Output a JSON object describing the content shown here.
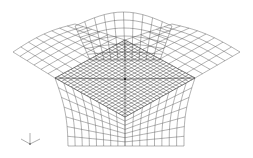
{
  "figure": {
    "regions": [
      {
        "name": "left-wing-surface",
        "grid_u": 8,
        "grid_v": 6
      },
      {
        "name": "right-wing-surface",
        "grid_u": 8,
        "grid_v": 6
      },
      {
        "name": "top-bulge-surface",
        "grid_u": 10,
        "grid_v": 6
      },
      {
        "name": "dense-center-square",
        "grid_u": 22,
        "grid_v": 22
      },
      {
        "name": "left-vertical-wall",
        "grid_u": 8,
        "grid_v": 7
      },
      {
        "name": "right-vertical-wall",
        "grid_u": 8,
        "grid_v": 7
      }
    ],
    "line_color": "#444444",
    "background": "#ffffff"
  },
  "axis_triad": {
    "icon": "xyz-axis-triad",
    "labels": [
      "",
      "",
      ""
    ]
  }
}
